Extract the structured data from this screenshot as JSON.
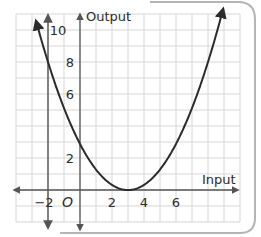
{
  "chart_data": {
    "type": "line",
    "title": "",
    "xlabel": "Input",
    "ylabel": "Output",
    "origin_label": "O",
    "xlim": [
      -4,
      10
    ],
    "ylim": [
      -2,
      11
    ],
    "x_ticks": [
      -2,
      2,
      4,
      6
    ],
    "x_tick_labels": [
      "−2",
      "2",
      "4",
      "6"
    ],
    "y_ticks": [
      2,
      6,
      8,
      10
    ],
    "y_tick_labels": [
      "2",
      "6",
      "8",
      "10"
    ],
    "grid": true,
    "grid_step": 1,
    "series": [
      {
        "name": "parabola",
        "equation": "y = 8/25 (x - 3)^2",
        "vertex": [
          3,
          0
        ],
        "points": [
          [
            -2.7,
            10.4
          ],
          [
            -2,
            8
          ],
          [
            0,
            2.88
          ],
          [
            1,
            1.28
          ],
          [
            2,
            0.32
          ],
          [
            3,
            0
          ],
          [
            4,
            0.32
          ],
          [
            5,
            1.28
          ],
          [
            6,
            2.88
          ],
          [
            8,
            8
          ],
          [
            8.9,
            11
          ]
        ],
        "color": "#2b2b2b"
      },
      {
        "name": "vertical line x = -2",
        "x": -2,
        "color": "#666666"
      }
    ],
    "annotations": [
      "Curve passes through (-2, 8)",
      "Vertex at (3, 0)"
    ]
  },
  "colors": {
    "grid": "#d6d6d6",
    "axis": "#555555",
    "curve": "#2b2b2b",
    "frame": "#b5b5b5"
  }
}
